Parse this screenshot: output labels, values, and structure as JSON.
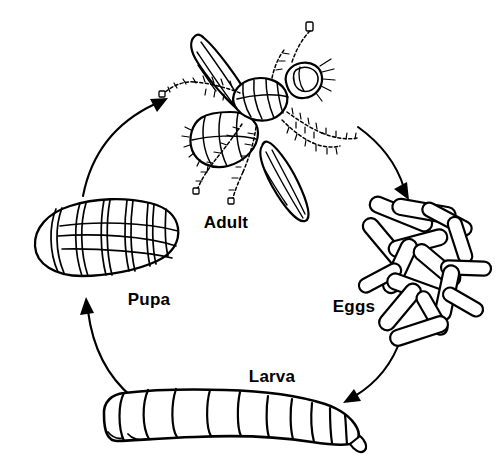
{
  "diagram": {
    "type": "cycle-diagram",
    "background_color": "#ffffff",
    "ink_color": "#000000",
    "stages": [
      {
        "id": "adult",
        "label": "Adult",
        "label_x": 226,
        "label_y": 228,
        "illustration": "adult-fly-drawing"
      },
      {
        "id": "eggs",
        "label": "Eggs",
        "label_x": 337,
        "label_y": 312,
        "illustration": "eggs-cluster-drawing"
      },
      {
        "id": "larva",
        "label": "Larva",
        "label_x": 247,
        "label_y": 382,
        "illustration": "larva-maggot-drawing"
      },
      {
        "id": "pupa",
        "label": "Pupa",
        "label_x": 131,
        "label_y": 305,
        "illustration": "pupa-case-drawing"
      }
    ],
    "arrows": [
      {
        "id": "adult-to-eggs",
        "from": "adult",
        "to": "eggs",
        "direction": "down-right"
      },
      {
        "id": "eggs-to-larva",
        "from": "eggs",
        "to": "larva",
        "direction": "down-left"
      },
      {
        "id": "larva-to-pupa",
        "from": "larva",
        "to": "pupa",
        "direction": "up-left"
      },
      {
        "id": "pupa-to-adult",
        "from": "pupa",
        "to": "adult",
        "direction": "up-right"
      }
    ]
  }
}
